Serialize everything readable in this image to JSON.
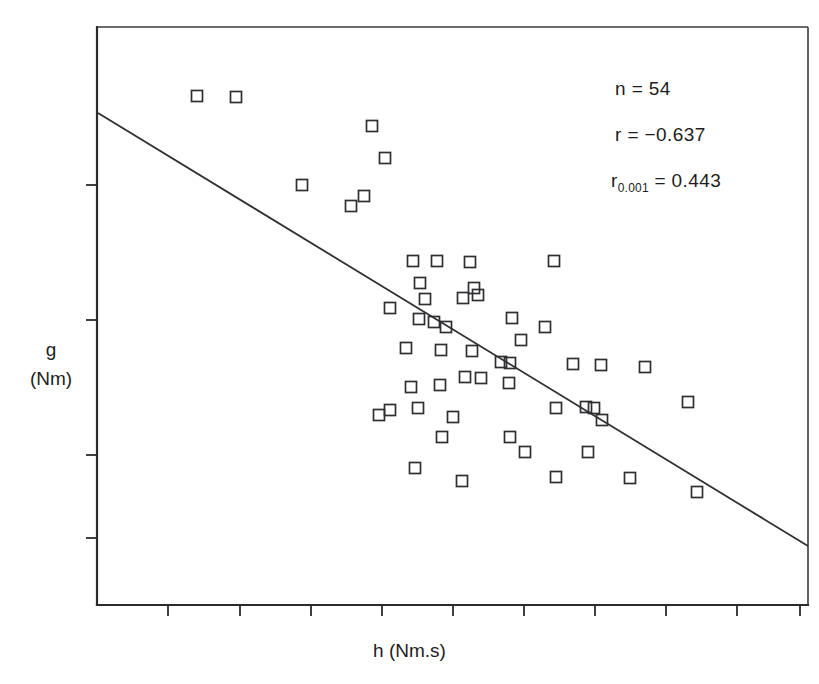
{
  "figure": {
    "axes": {
      "x_label": "h  (Nm.s)",
      "y_label_line1": "g",
      "y_label_line2": "(Nm)"
    },
    "annotations": {
      "n_label": "n = 54",
      "r_label": "r = −0.637",
      "rcrit_prefix": "r",
      "rcrit_subscript": "0.001",
      "rcrit_suffix": " = 0.443"
    }
  },
  "chart_data": {
    "type": "scatter",
    "title": "",
    "subtitle": "",
    "xlabel": "h  (Nm.s)",
    "ylabel": "g  (Nm)",
    "grid": false,
    "legend": null,
    "marker_style": "open-square",
    "n": 54,
    "r": -0.637,
    "r_critical_0_001": 0.443,
    "axis_tick_labels_shown": false,
    "x_tick_count": 10,
    "y_tick_count": 4,
    "plot_area_px": {
      "left": 97,
      "top": 27,
      "right": 808,
      "bottom": 605
    },
    "x_ticks_px": [
      168,
      240,
      311,
      382,
      453,
      524,
      595,
      666,
      737,
      800
    ],
    "y_ticks_px": [
      185,
      320,
      455,
      538
    ],
    "regression_line_px": {
      "x1": 98,
      "y1": 113,
      "x2": 808,
      "y2": 546
    },
    "points_px": [
      [
        197,
        96
      ],
      [
        236,
        97
      ],
      [
        372,
        126
      ],
      [
        385,
        158
      ],
      [
        302,
        185
      ],
      [
        364,
        196
      ],
      [
        351,
        206
      ],
      [
        413,
        261
      ],
      [
        437,
        261
      ],
      [
        470,
        262
      ],
      [
        554,
        261
      ],
      [
        420,
        283
      ],
      [
        425,
        299
      ],
      [
        390,
        308
      ],
      [
        419,
        319
      ],
      [
        463,
        298
      ],
      [
        474,
        288
      ],
      [
        478,
        295
      ],
      [
        434,
        322
      ],
      [
        512,
        318
      ],
      [
        545,
        327
      ],
      [
        446,
        327
      ],
      [
        521,
        340
      ],
      [
        406,
        348
      ],
      [
        441,
        350
      ],
      [
        472,
        351
      ],
      [
        501,
        362
      ],
      [
        510,
        363
      ],
      [
        573,
        364
      ],
      [
        601,
        365
      ],
      [
        645,
        367
      ],
      [
        465,
        377
      ],
      [
        481,
        378
      ],
      [
        509,
        383
      ],
      [
        411,
        387
      ],
      [
        440,
        385
      ],
      [
        379,
        415
      ],
      [
        390,
        410
      ],
      [
        418,
        408
      ],
      [
        453,
        417
      ],
      [
        556,
        408
      ],
      [
        586,
        407
      ],
      [
        594,
        408
      ],
      [
        602,
        420
      ],
      [
        688,
        402
      ],
      [
        442,
        437
      ],
      [
        510,
        437
      ],
      [
        525,
        452
      ],
      [
        415,
        468
      ],
      [
        462,
        481
      ],
      [
        556,
        477
      ],
      [
        630,
        478
      ],
      [
        697,
        492
      ],
      [
        588,
        452
      ]
    ]
  }
}
